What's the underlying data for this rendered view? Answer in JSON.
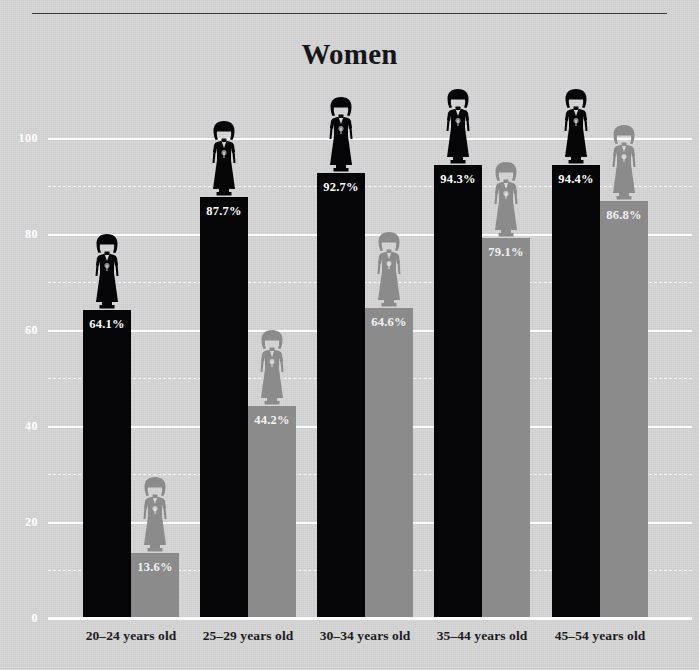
{
  "title": "Women",
  "colors": {
    "background": "#d5d5d5",
    "dark_series": "#050507",
    "light_series": "#8b8b8b",
    "gridline": "#ffffff",
    "label_text": "#1c1c1f",
    "rule": "#3a3a3c"
  },
  "axis": {
    "y_ticks": [
      "0",
      "20",
      "40",
      "60",
      "80",
      "100"
    ],
    "y_tick_values": [
      0,
      20,
      40,
      60,
      80,
      100
    ],
    "y_minor_values": [
      10,
      30,
      50,
      70,
      90
    ]
  },
  "chart_data": {
    "type": "bar",
    "title": "Women",
    "xlabel": "",
    "ylabel": "",
    "ylim": [
      0,
      105
    ],
    "grid": true,
    "legend": "none",
    "categories": [
      "20–24 years old",
      "25–29 years old",
      "30–34 years old",
      "35–44 years old",
      "45–54 years old"
    ],
    "series": [
      {
        "name": "dark",
        "color": "#050507",
        "values": [
          64.1,
          87.7,
          92.7,
          94.3,
          94.4
        ],
        "labels": [
          "64.1%",
          "87.7%",
          "92.7%",
          "94.3%",
          "94.4%"
        ]
      },
      {
        "name": "light",
        "color": "#8b8b8b",
        "values": [
          13.6,
          44.2,
          64.6,
          79.1,
          86.8
        ],
        "labels": [
          "13.6%",
          "44.2%",
          "64.6%",
          "79.1%",
          "86.8%"
        ]
      }
    ]
  },
  "icons": {
    "figure_dark": "woman-figure-icon",
    "figure_light": "woman-figure-icon"
  }
}
